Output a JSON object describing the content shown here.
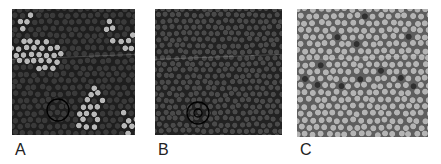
{
  "figure": {
    "panels": [
      {
        "id": "A",
        "label": "A",
        "background": "#1e1e1e",
        "cell_color": "#3a3a3a",
        "bright_cell_color": "#b8b8b8",
        "bright_fraction": 0.22,
        "marker": "circle-outline"
      },
      {
        "id": "B",
        "label": "B",
        "background": "#222222",
        "cell_color": "#4a4a4a",
        "bright_cell_color": "#5a5a5a",
        "bright_fraction": 0.0,
        "marker": "concentric-circles"
      },
      {
        "id": "C",
        "label": "C",
        "background": "#5e5e5e",
        "cell_color": "#b4b4b4",
        "dark_cell_color": "#303030",
        "dark_count": 12,
        "marker": "none"
      }
    ]
  }
}
